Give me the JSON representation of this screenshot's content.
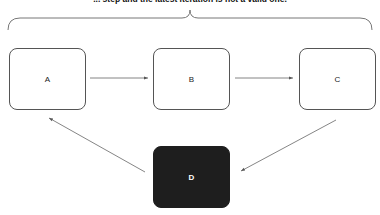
{
  "caption": "... step and the latest iteration is not a valid one.",
  "nodes": [
    {
      "id": "A",
      "label": "A"
    },
    {
      "id": "B",
      "label": "B"
    },
    {
      "id": "C",
      "label": "C"
    },
    {
      "id": "D",
      "label": "D",
      "fill": "#1e1e1e"
    }
  ],
  "edges": [
    {
      "from": "A",
      "to": "B"
    },
    {
      "from": "B",
      "to": "C"
    },
    {
      "from": "C",
      "to": "D"
    },
    {
      "from": "D",
      "to": "A"
    }
  ],
  "colors": {
    "line": "#666666",
    "dark_node": "#1e1e1e"
  }
}
